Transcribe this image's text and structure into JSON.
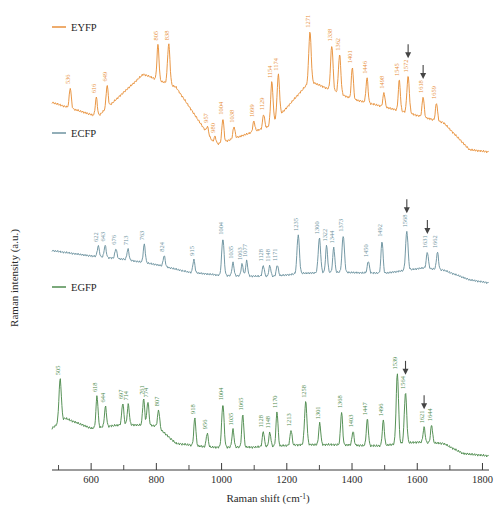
{
  "figure": {
    "title": "",
    "background": "#ffffff"
  },
  "axes": {
    "x": {
      "label_text": "Raman shift (cm",
      "label_sup": "-1",
      "label_tail": ")",
      "ticks": [
        600,
        800,
        1000,
        1200,
        1400,
        1600,
        1800
      ],
      "minor_ticks": [
        500,
        700,
        900,
        1100,
        1300,
        1500,
        1700
      ],
      "range": [
        480,
        1820
      ]
    },
    "y": {
      "label": "Raman intensity (a.u.)",
      "ticks": []
    }
  },
  "legend": {
    "position": "inside-left",
    "items": [
      {
        "label": "EYFP",
        "color": "#E8913C"
      },
      {
        "label": "ECFP",
        "color": "#6E93A0"
      },
      {
        "label": "EGFP",
        "color": "#4F8C4F"
      }
    ]
  },
  "chart_data": {
    "type": "line",
    "title": "",
    "xlabel": "Raman shift (cm-1)",
    "ylabel": "Raman intensity (a.u.)",
    "xlim": [
      480,
      1820
    ],
    "grid": false,
    "legend_position": "inside-left",
    "series": [
      {
        "name": "EYFP",
        "color": "#E8913C",
        "peaks": [
          536,
          616,
          649,
          805,
          838,
          957,
          980,
          1004,
          1038,
          1099,
          1129,
          1154,
          1174,
          1271,
          1338,
          1362,
          1401,
          1446,
          1498,
          1545,
          1572,
          1618,
          1659
        ],
        "arrows": [
          1572,
          1618
        ]
      },
      {
        "name": "ECFP",
        "color": "#6E93A0",
        "peaks": [
          622,
          643,
          676,
          713,
          763,
          824,
          915,
          1004,
          1035,
          1063,
          1077,
          1128,
          1148,
          1171,
          1235,
          1300,
          1322,
          1344,
          1373,
          1450,
          1492,
          1568,
          1631,
          1662
        ],
        "arrows": [
          1568,
          1631
        ]
      },
      {
        "name": "EGFP",
        "color": "#4F8C4F",
        "peaks": [
          505,
          618,
          644,
          697,
          714,
          761,
          774,
          807,
          918,
          956,
          1004,
          1035,
          1065,
          1128,
          1148,
          1170,
          1213,
          1258,
          1301,
          1368,
          1403,
          1447,
          1496,
          1539,
          1564,
          1621,
          1644
        ],
        "arrows": [
          1564,
          1621
        ]
      }
    ]
  }
}
